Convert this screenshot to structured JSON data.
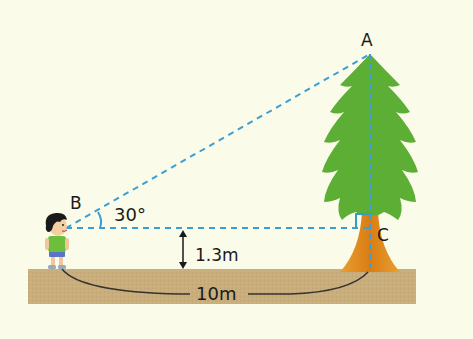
{
  "diagram": {
    "points": {
      "A": {
        "label": "A",
        "x": 370,
        "y": 54
      },
      "B": {
        "label": "B",
        "x": 66,
        "y": 228
      },
      "C": {
        "label": "C",
        "x": 370,
        "y": 228
      }
    },
    "labels": {
      "point_a": "A",
      "point_b": "B",
      "point_c": "C",
      "angle": "30°",
      "eye_height": "1.3m",
      "distance": "10m"
    },
    "colors": {
      "background": "#fbfbe9",
      "dashed_line": "#3a9fd6",
      "tree_foliage": "#5cae35",
      "tree_trunk": "#e08a1e",
      "ground": "#c8ad7a",
      "text": "#1a1a1a"
    },
    "objects": [
      "boy-observer",
      "tree",
      "ground"
    ]
  }
}
